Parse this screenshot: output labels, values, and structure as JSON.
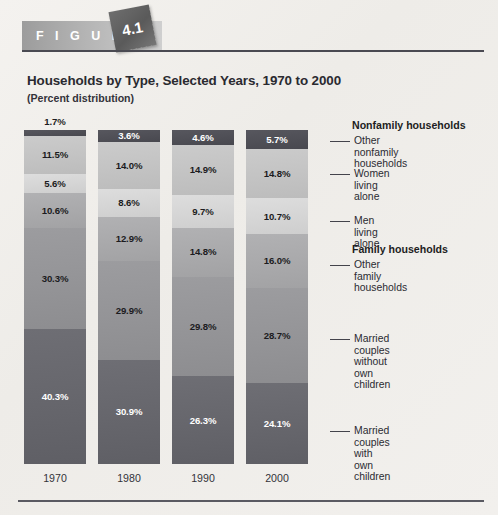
{
  "figure": {
    "label": "F I G U R E",
    "number": "4.1"
  },
  "chart_title": "Households by Type, Selected Years, 1970 to 2000",
  "chart_subtitle": "(Percent distribution)",
  "legend_headings": {
    "nonfamily": "Nonfamily households",
    "family": "Family households"
  },
  "legend": [
    {
      "name": "other-nonfamily-households",
      "label": "Other nonfamily\nhouseholds"
    },
    {
      "name": "women-living-alone",
      "label": "Women living alone"
    },
    {
      "name": "men-living-alone",
      "label": "Men living alone"
    },
    {
      "name": "other-family-households",
      "label": "Other family\nhouseholds"
    },
    {
      "name": "married-couples-without-own-children",
      "label": "Married couples\nwithout own children"
    },
    {
      "name": "married-couples-with-own-children",
      "label": "Married couples with\nown children"
    }
  ],
  "source_note": "",
  "chart_data": {
    "type": "bar",
    "subtype": "stacked-100-percent-column",
    "title": "Households by Type, Selected Years, 1970 to 2000",
    "subtitle": "(Percent distribution)",
    "xlabel": "",
    "ylabel": "Percent distribution",
    "ylim": [
      0,
      100
    ],
    "grid": false,
    "legend_position": "right",
    "categories": [
      "1970",
      "1980",
      "1990",
      "2000"
    ],
    "series": [
      {
        "name": "Other nonfamily households",
        "group": "Nonfamily households",
        "values": [
          1.7,
          3.6,
          4.6,
          5.7
        ],
        "labels": [
          "1.7%",
          "3.6%",
          "4.6%",
          "5.7%"
        ],
        "color": "#4f4f56",
        "text": "dark"
      },
      {
        "name": "Women living alone",
        "group": "Nonfamily households",
        "values": [
          11.5,
          14.0,
          14.9,
          14.8
        ],
        "labels": [
          "11.5%",
          "14.0%",
          "14.9%",
          "14.8%"
        ],
        "color": "#c3c3c3",
        "text": "light"
      },
      {
        "name": "Men living alone",
        "group": "Nonfamily households",
        "values": [
          5.6,
          8.6,
          9.7,
          10.7
        ],
        "labels": [
          "5.6%",
          "8.6%",
          "9.7%",
          "10.7%"
        ],
        "color": "#d5d5d5",
        "text": "light"
      },
      {
        "name": "Other family households",
        "group": "Family households",
        "values": [
          10.6,
          12.9,
          14.8,
          16.0
        ],
        "labels": [
          "10.6%",
          "12.9%",
          "14.8%",
          "16.0%"
        ],
        "color": "#a9a9ab",
        "text": "light"
      },
      {
        "name": "Married couples without own children",
        "group": "Family households",
        "values": [
          30.3,
          29.9,
          29.8,
          28.7
        ],
        "labels": [
          "30.3%",
          "29.9%",
          "29.8%",
          "28.7%"
        ],
        "color": "#949497",
        "text": "light"
      },
      {
        "name": "Married couples with own children",
        "group": "Family households",
        "values": [
          40.3,
          30.9,
          26.3,
          24.1
        ],
        "labels": [
          "40.3%",
          "30.9%",
          "26.3%",
          "24.1%"
        ],
        "color": "#66666c",
        "text": "dark"
      }
    ]
  }
}
